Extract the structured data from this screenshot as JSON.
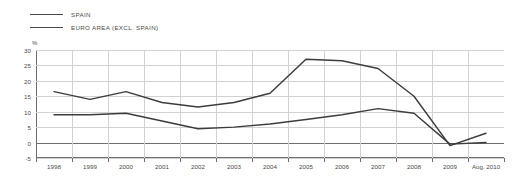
{
  "legend": {
    "position": "top-left",
    "items": [
      {
        "label": "SPAIN",
        "color": "#4a4a4a"
      },
      {
        "label": "EURO AREA (EXCL. SPAIN)",
        "color": "#4a4a4a"
      }
    ]
  },
  "axis": {
    "unit": "%",
    "y_ticks": [
      "30",
      "25",
      "20",
      "15",
      "10",
      "5",
      "0",
      "-5"
    ],
    "x_ticks": [
      "1998",
      "1999",
      "2000",
      "2001",
      "2002",
      "2003",
      "2004",
      "2005",
      "2006",
      "2007",
      "2008",
      "2009",
      "Aug. 2010"
    ]
  },
  "chart_data": {
    "type": "line",
    "title": "",
    "subtitle": "",
    "xlabel": "",
    "ylabel": "%",
    "ylim": [
      -5,
      30
    ],
    "grid": true,
    "legend_position": "top-left",
    "x": [
      "1998",
      "1999",
      "2000",
      "2001",
      "2002",
      "2003",
      "2004",
      "2005",
      "2006",
      "2007",
      "2008",
      "2009",
      "Aug. 2010"
    ],
    "series": [
      {
        "name": "SPAIN",
        "color": "#3c3c3c",
        "values": [
          16.5,
          14.0,
          16.5,
          13.0,
          11.5,
          13.0,
          16.0,
          27.0,
          26.5,
          24.0,
          15.0,
          -1.0,
          3.0
        ]
      },
      {
        "name": "EURO AREA (EXCL. SPAIN)",
        "color": "#3c3c3c",
        "values": [
          9.0,
          9.0,
          9.5,
          7.0,
          4.5,
          5.0,
          6.0,
          7.5,
          9.0,
          11.0,
          9.5,
          -0.5,
          0.0
        ]
      }
    ]
  }
}
